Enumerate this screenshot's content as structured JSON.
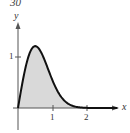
{
  "corner_label": "30",
  "chart_data": {
    "type": "area",
    "title": "",
    "xlabel": "x",
    "ylabel": "y",
    "x_ticks": [
      "1",
      "2"
    ],
    "y_ticks": [
      "1"
    ],
    "xlim": [
      0,
      2.9
    ],
    "ylim": [
      0,
      1.6
    ],
    "grid": false,
    "function": "y = 4x·e^(-2x^2)",
    "x": [
      0,
      0.1,
      0.2,
      0.3,
      0.4,
      0.5,
      0.6,
      0.7,
      0.8,
      0.9,
      1.0,
      1.2,
      1.4,
      1.6,
      1.8,
      2.0,
      2.5
    ],
    "values": [
      0,
      0.39,
      0.74,
      1.0,
      1.16,
      1.21,
      1.17,
      1.05,
      0.89,
      0.71,
      0.54,
      0.27,
      0.11,
      0.04,
      0.01,
      0.0,
      0.0
    ],
    "fill": "#d9d9d9",
    "line_color": "#111111"
  },
  "axes": {
    "x_label": "x",
    "y_label": "y",
    "x_tick_1": "1",
    "x_tick_2": "2",
    "y_tick_1": "1"
  }
}
